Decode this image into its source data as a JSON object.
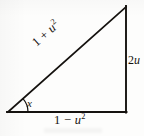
{
  "figure": {
    "kind": "right-triangle-diagram",
    "ink_color": "#15120f",
    "paper_color": "#fdfdfc",
    "stroke_width_px": 1.6,
    "vertices": {
      "left": {
        "x": 8,
        "y": 112
      },
      "right_bottom": {
        "x": 126,
        "y": 112
      },
      "right_top": {
        "x": 126,
        "y": 7
      }
    },
    "labels": {
      "hypotenuse": {
        "prefix": "1 + ",
        "base": "u",
        "exponent": "2",
        "full_text": "1 + u²",
        "rotation_deg": -41.6
      },
      "vertical_leg": {
        "coefficient": "2",
        "base": "u",
        "full_text": "2u"
      },
      "horizontal_leg": {
        "prefix": "1 − ",
        "base": "u",
        "exponent": "2",
        "full_text": "1 − u²"
      },
      "angle": {
        "symbol": "x",
        "arc_radius_px": 20,
        "measure_deg": 41.6
      }
    }
  }
}
